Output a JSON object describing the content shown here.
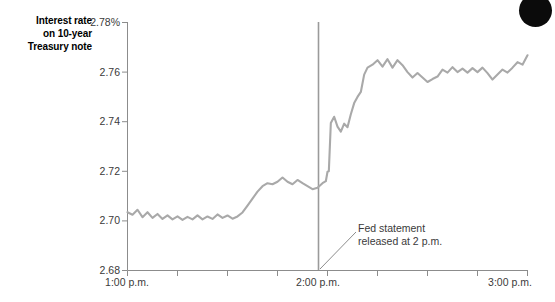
{
  "chart_data": {
    "type": "line",
    "title": "",
    "ylabel": "Interest rate on 10-year Treasury note",
    "xlabel": "",
    "ylim": [
      2.68,
      2.78
    ],
    "yticks": [
      2.78,
      2.76,
      2.74,
      2.72,
      2.7,
      2.68
    ],
    "ytick_labels": [
      "2.78%",
      "2.76",
      "2.74",
      "2.72",
      "2.70",
      "2.68"
    ],
    "xlim": [
      0,
      120
    ],
    "xticks": [
      0,
      15,
      30,
      45,
      60,
      75,
      90,
      105,
      120
    ],
    "xtick_labels": [
      "1:00 p.m.",
      "",
      "",
      "",
      "2:00 p.m.",
      "",
      "",
      "",
      "3:00 p.m."
    ],
    "xtick_labels_visible": [
      "1:00 p.m.",
      "2:00 p.m.",
      "3:00 p.m."
    ],
    "grid": false,
    "legend": false,
    "line_color": "#a9a9a9",
    "series": [
      {
        "name": "Interest rate on 10-year Treasury note",
        "x": [
          0,
          1.5,
          3,
          4.5,
          6,
          7.5,
          9,
          10.5,
          12,
          13.5,
          15,
          16.5,
          18,
          19.5,
          21,
          22.5,
          24,
          25.5,
          27,
          28.5,
          30,
          31.5,
          33,
          34.5,
          36,
          37.5,
          39,
          40.5,
          42,
          43.5,
          45,
          46.5,
          48,
          49.5,
          51,
          52.5,
          54,
          55.5,
          57,
          58.5,
          59.5,
          60,
          60.4,
          61,
          62,
          63,
          64,
          65,
          66,
          67,
          68,
          69,
          70,
          71,
          72,
          73.5,
          75,
          76.5,
          78,
          79.5,
          81,
          82.5,
          84,
          85.5,
          87,
          88.5,
          90,
          91.5,
          93,
          94.5,
          96,
          97.5,
          99,
          100.5,
          102,
          103.5,
          105,
          106.5,
          108,
          109.5,
          111,
          112.5,
          114,
          115.5,
          117,
          118.5,
          120
        ],
        "y": [
          2.7035,
          2.7025,
          2.7045,
          2.7015,
          2.7035,
          2.7012,
          2.7028,
          2.7008,
          2.7022,
          2.7006,
          2.7018,
          2.7004,
          2.7016,
          2.7006,
          2.7022,
          2.7006,
          2.7018,
          2.7008,
          2.7026,
          2.7012,
          2.7022,
          2.7009,
          2.7018,
          2.7034,
          2.7062,
          2.709,
          2.7118,
          2.714,
          2.7152,
          2.7148,
          2.7158,
          2.7175,
          2.7158,
          2.7148,
          2.7165,
          2.7152,
          2.714,
          2.7128,
          2.7134,
          2.7152,
          2.716,
          2.7198,
          2.72,
          2.7395,
          2.742,
          2.738,
          2.736,
          2.7392,
          2.7378,
          2.743,
          2.7475,
          2.75,
          2.752,
          2.759,
          2.7618,
          2.763,
          2.7648,
          2.7622,
          2.7652,
          2.7618,
          2.7648,
          2.7628,
          2.76,
          2.7578,
          2.7596,
          2.7578,
          2.756,
          2.7572,
          2.7582,
          2.761,
          2.7598,
          2.762,
          2.76,
          2.7614,
          2.7598,
          2.7616,
          2.76,
          2.7618,
          2.7596,
          2.757,
          2.759,
          2.761,
          2.7598,
          2.7618,
          2.764,
          2.763,
          2.7668
        ]
      }
    ],
    "event_line": {
      "x": 60,
      "label": "Fed statement\nreleased at 2 p.m.",
      "color": "#9a9a9a"
    },
    "annotation": {
      "line1": "Fed statement",
      "line2": "released at 2 p.m."
    }
  },
  "axis": {
    "ylabel_line1": "Interest rate",
    "ylabel_line2": "on 10-year",
    "ylabel_line3": "Treasury note",
    "ytick_0": "2.78%",
    "ytick_1": "2.76",
    "ytick_2": "2.74",
    "ytick_3": "2.72",
    "ytick_4": "2.70",
    "ytick_5": "2.68",
    "xtick_0": "1:00 p.m.",
    "xtick_1": "2:00 p.m.",
    "xtick_2": "3:00 p.m."
  },
  "annotation": {
    "text": "Fed statement\nreleased at 2 p.m."
  },
  "colors": {
    "line": "#a9a9a9",
    "axis": "#8c8c8c",
    "text": "#3a3a3a",
    "dot": "#0b0b0b"
  }
}
